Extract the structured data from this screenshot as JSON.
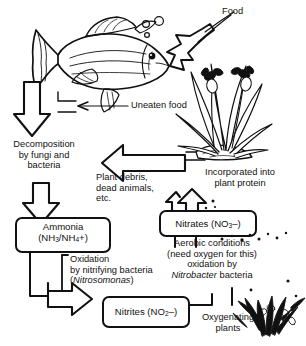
{
  "diagram": {
    "ink_color": "#111111",
    "background_color": "#ffffff"
  },
  "labels": {
    "food": "Food",
    "uneaten_food": "Uneaten food",
    "decomposition_l1": "Decomposition",
    "decomposition_l2": "by fungi and",
    "decomposition_l3": "bacteria",
    "plant_debris_l1": "Plant debris,",
    "plant_debris_l2": "dead animals,",
    "plant_debris_l3": "etc.",
    "incorporated_l1": "Incorporated into",
    "incorporated_l2": "plant protein",
    "oxidation_l1": "Oxidation",
    "oxidation_l2": "by nitrifying bacteria",
    "oxidation_genus": "Nitrosomonas",
    "oxidation_genus_open": "(",
    "oxidation_genus_close": ")",
    "aerobic_l1": "Aerobic conditions",
    "aerobic_l2": "(need oxygen for this)",
    "aerobic_l3": "oxidation by",
    "aerobic_genus": "Nitrobacter",
    "aerobic_l4_tail": " bacteria",
    "oxygenating_l1": "Oxygenating",
    "oxygenating_l2": "plants"
  },
  "boxes": {
    "ammonia": {
      "name_line": "Ammonia",
      "formula_prefix": "(NH",
      "formula_sub1": "3",
      "formula_mid": "/NH",
      "formula_sub2": "4",
      "formula_suffix": "+)"
    },
    "nitrites": {
      "prefix": "Nitrites (NO",
      "sub": "2",
      "suffix": "–)"
    },
    "nitrates": {
      "prefix": "Nitrates (NO",
      "sub": "3",
      "suffix": "–)"
    }
  },
  "illustrations": {
    "fish": "fish-illustration",
    "bubbles": "bubbles-illustration",
    "marsh_plant": "marsh-plant-illustration",
    "oxygenating_plant": "oxygenating-plant-illustration"
  }
}
